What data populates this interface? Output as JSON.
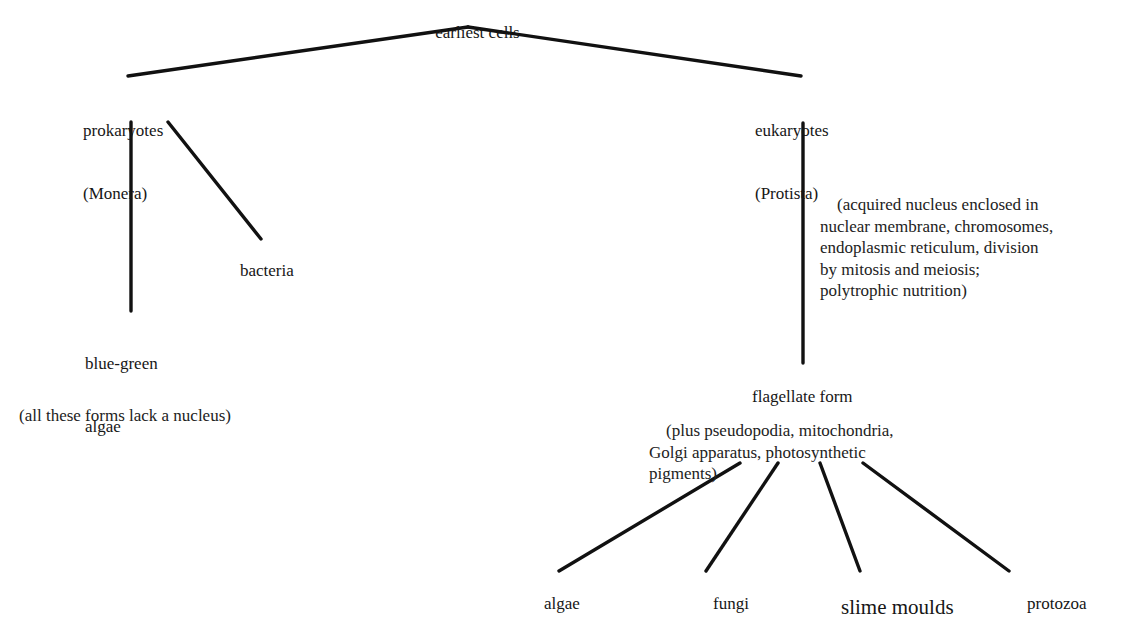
{
  "diagram": {
    "title": "earliest cells",
    "background_color": "#ffffff",
    "line_color": "#111111",
    "nodes": {
      "root": {
        "label": "earliest cells"
      },
      "prokaryotes": {
        "line1": "prokaryotes",
        "line2": "(Monera)"
      },
      "eukaryotes": {
        "line1": "eukaryotes",
        "line2": "(Protista)"
      },
      "bacteria": {
        "label": "bacteria"
      },
      "blue_green_algae": {
        "line1": "blue-green",
        "line2": "algae"
      },
      "flagellate_form": {
        "label": "flagellate form"
      },
      "algae": {
        "label": "algae"
      },
      "fungi": {
        "label": "fungi"
      },
      "slime_moulds": {
        "label": "slime moulds"
      },
      "protozoa": {
        "label": "protozoa"
      }
    },
    "annotations": {
      "prokaryote_note": "(all these forms lack a nucleus)",
      "eukaryote_note": "(acquired nucleus enclosed in\nnuclear membrane, chromosomes,\nendoplasmic reticulum, division\nby mitosis and meiosis;\npolytrophic nutrition)",
      "flagellate_note": "(plus pseudopodia, mitochondria,\nGolgi apparatus, photosynthetic\npigments)"
    },
    "edges": [
      {
        "name": "root-to-prokaryotes",
        "x1": 468,
        "y1": 27,
        "x2": 128,
        "y2": 76
      },
      {
        "name": "root-to-eukaryotes",
        "x1": 468,
        "y1": 27,
        "x2": 801,
        "y2": 76
      },
      {
        "name": "prokaryotes-to-blue-green-algae",
        "x1": 131,
        "y1": 122,
        "x2": 131,
        "y2": 311
      },
      {
        "name": "prokaryotes-to-bacteria",
        "x1": 168,
        "y1": 122,
        "x2": 261,
        "y2": 239
      },
      {
        "name": "eukaryotes-to-flagellate-form",
        "x1": 803,
        "y1": 123,
        "x2": 803,
        "y2": 363
      },
      {
        "name": "flagellate-to-algae",
        "x1": 740,
        "y1": 463,
        "x2": 559,
        "y2": 571
      },
      {
        "name": "flagellate-to-fungi",
        "x1": 778,
        "y1": 463,
        "x2": 706,
        "y2": 571
      },
      {
        "name": "flagellate-to-slime-moulds",
        "x1": 820,
        "y1": 463,
        "x2": 860,
        "y2": 571
      },
      {
        "name": "flagellate-to-protozoa",
        "x1": 863,
        "y1": 463,
        "x2": 1009,
        "y2": 571
      }
    ]
  }
}
